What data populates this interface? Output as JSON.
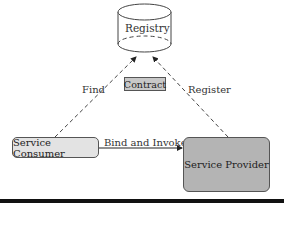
{
  "diagram": {
    "registry": {
      "label": "Registry",
      "shape": "cylinder"
    },
    "contract": {
      "label": "Contract"
    },
    "consumer": {
      "label": "Service Consumer",
      "fill": "#e3e3e3"
    },
    "provider": {
      "label": "Service Provider",
      "fill": "#b4b4b4"
    },
    "edges": {
      "find": {
        "label": "Find",
        "style": "dashed",
        "from": "Service Consumer",
        "to": "Registry"
      },
      "register": {
        "label": "Register",
        "style": "dashed",
        "from": "Service Provider",
        "to": "Registry"
      },
      "bind": {
        "label": "Bind and Invoke",
        "style": "solid",
        "from": "Service Consumer",
        "to": "Service Provider"
      }
    }
  }
}
